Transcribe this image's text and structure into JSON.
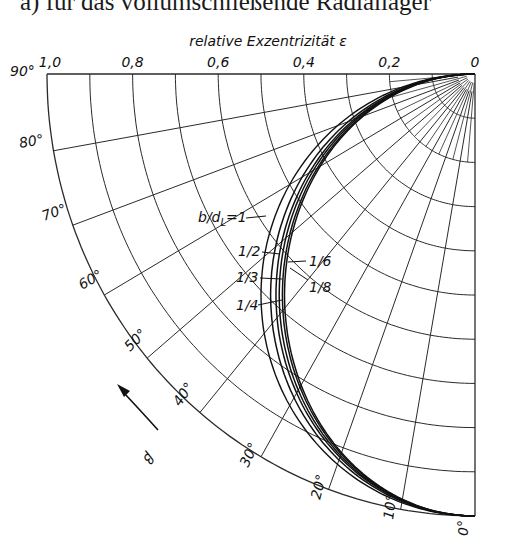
{
  "caption": "a) für das vollumschließende Radiallager",
  "chart_data": {
    "type": "polar-line",
    "title": "a) für das vollumschließende Radiallager",
    "axis_title": "relative Exzentrizität ε",
    "radial_axis": {
      "name": "relative Exzentrizität ε",
      "range": [
        0,
        1.0
      ],
      "ticks": [
        1.0,
        0.8,
        0.6,
        0.4,
        0.2,
        0
      ],
      "tick_labels": [
        "1,0",
        "0,8",
        "0,6",
        "0,4",
        "0,2",
        "0"
      ],
      "grid_step": 0.1
    },
    "angular_axis": {
      "name": "β",
      "range_deg": [
        0,
        90
      ],
      "ticks_deg": [
        0,
        10,
        20,
        30,
        40,
        50,
        60,
        70,
        80,
        90
      ],
      "tick_labels": [
        "0°",
        "10°",
        "20°",
        "30°",
        "40°",
        "50°",
        "60°",
        "70°",
        "80°",
        "90°"
      ],
      "grid_step_deg": 10,
      "arrow_label": "β"
    },
    "grid": true,
    "series": [
      {
        "name": "b/d_L=1",
        "bulge": 1.0
      },
      {
        "name": "1/2",
        "bulge": 0.955
      },
      {
        "name": "1/3",
        "bulge": 0.93
      },
      {
        "name": "1/4",
        "bulge": 0.915
      },
      {
        "name": "1/6",
        "bulge": 0.9
      },
      {
        "name": "1/8",
        "bulge": 0.89
      }
    ],
    "series_labels": [
      {
        "text": "b/d",
        "sub": "L",
        "suffix": "=1",
        "x": 198,
        "y": 222,
        "lx1": 246,
        "ly1": 218,
        "lx2": 266,
        "ly2": 216
      },
      {
        "text": "1/2",
        "x": 238,
        "y": 256,
        "lx1": 262,
        "ly1": 252,
        "lx2": 280,
        "ly2": 254
      },
      {
        "text": "1/3",
        "x": 236,
        "y": 282,
        "lx1": 260,
        "ly1": 278,
        "lx2": 282,
        "ly2": 279
      },
      {
        "text": "1/4",
        "x": 236,
        "y": 310,
        "lx1": 258,
        "ly1": 305,
        "lx2": 282,
        "ly2": 300
      },
      {
        "text": "1/6",
        "x": 309,
        "y": 266,
        "lx1": 306,
        "ly1": 261,
        "lx2": 288,
        "ly2": 262
      },
      {
        "text": "1/8",
        "x": 309,
        "y": 292,
        "lx1": 308,
        "ly1": 280,
        "lx2": 290,
        "ly2": 268
      }
    ]
  },
  "geometry": {
    "cx": 475,
    "cy": 74,
    "rx": 428,
    "ry": 442
  },
  "colors": {
    "ink": "#111111",
    "grid": "#2a2a2a",
    "background": "#ffffff"
  }
}
